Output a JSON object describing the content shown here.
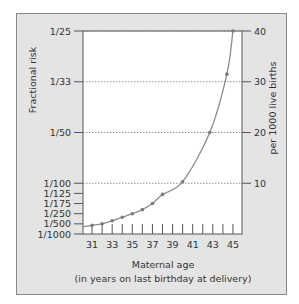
{
  "chart_data": {
    "type": "line",
    "title": "",
    "xlabel": "Maternal age",
    "xlabel_sub": "(in years on last birthday at delivery)",
    "ylabel_left": "Fractional risk",
    "ylabel_right": "per 1000 live births",
    "x_ticks": [
      31,
      33,
      35,
      37,
      39,
      41,
      43,
      45
    ],
    "x_minor_ticks": [
      31,
      32,
      33,
      34,
      35,
      36,
      37,
      38,
      39,
      40,
      41,
      42,
      43,
      44,
      45
    ],
    "xlim": [
      30.1,
      45.9
    ],
    "ylim": [
      0,
      40
    ],
    "y_right_ticks": [
      10,
      20,
      30,
      40
    ],
    "y_left_ticks": [
      {
        "label": "1/25",
        "value": 40
      },
      {
        "label": "1/33",
        "value": 30
      },
      {
        "label": "1/50",
        "value": 20
      },
      {
        "label": "1/100",
        "value": 10
      },
      {
        "label": "1/125",
        "value": 8
      },
      {
        "label": "1/175",
        "value": 6
      },
      {
        "label": "1/250",
        "value": 4
      },
      {
        "label": "1/500",
        "value": 2
      },
      {
        "label": "1/1000",
        "value": 0
      }
    ],
    "gridlines": [
      10,
      20,
      30,
      40
    ],
    "series": [
      {
        "name": "Risk per 1000 live births",
        "x": [
          31,
          32,
          33,
          34,
          35,
          36,
          37,
          38,
          40,
          42.7,
          44.4,
          45
        ],
        "values": [
          1.7,
          2.0,
          2.6,
          3.3,
          4.0,
          4.8,
          6.0,
          7.8,
          10.3,
          20.0,
          31.5,
          40.0
        ]
      }
    ],
    "colors": {
      "frame_bg": "#e4e4e4",
      "plot_bg": "#ffffff",
      "line": "#8c8c8c",
      "grid": "#777777"
    }
  }
}
